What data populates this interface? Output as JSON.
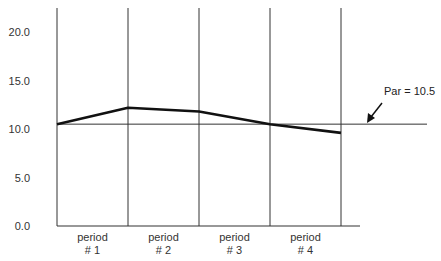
{
  "chart_data": {
    "type": "line",
    "title": "",
    "xlabel": "",
    "ylabel": "",
    "categories": [
      "period\n# 1",
      "period\n# 2",
      "period\n# 3",
      "period\n# 4"
    ],
    "category_lines": [
      [
        "period",
        "# 1"
      ],
      [
        "period",
        "# 2"
      ],
      [
        "period",
        "# 3"
      ],
      [
        "period",
        "# 4"
      ]
    ],
    "x_boundaries": [
      0,
      1,
      2,
      3,
      4
    ],
    "series": [
      {
        "name": "value",
        "x": [
          0,
          1,
          2,
          3,
          4
        ],
        "values": [
          10.5,
          12.2,
          11.8,
          10.5,
          9.6
        ]
      }
    ],
    "reference_line": {
      "label": "Par = 10.5",
      "value": 10.5
    },
    "yticks": [
      "0.0",
      "5.0",
      "10.0",
      "15.0",
      "20.0"
    ],
    "ytick_values": [
      0,
      5,
      10,
      15,
      20
    ],
    "ylim": [
      0,
      22.6
    ],
    "grid": {
      "vertical": true,
      "horizontal": false
    },
    "legend": null
  },
  "colors": {
    "line": "#111111",
    "grid": "#333333",
    "text": "#333333"
  }
}
